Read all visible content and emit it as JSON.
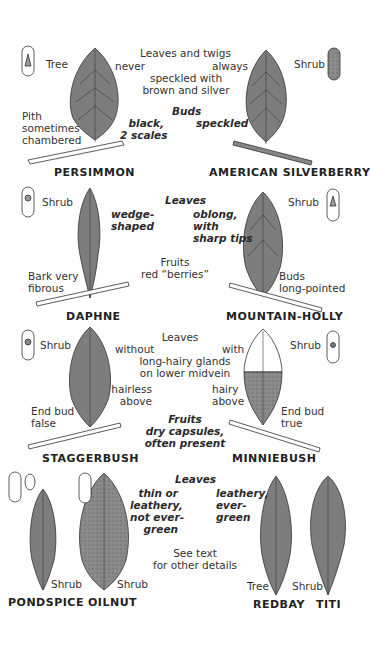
{
  "colors": {
    "leaf_fill": "#7d7d7d",
    "leaf_stroke": "#333333",
    "vein": "#3a3a3a",
    "text": "#333333",
    "background": "#ffffff"
  },
  "panels": [
    {
      "species": [
        {
          "name": "PERSIMMON",
          "habit": "Tree",
          "note": [
            "Pith",
            "sometimes",
            "chambered"
          ],
          "icon": "pith-chambered-icon"
        },
        {
          "name": "AMERICAN SILVERBERRY",
          "habit": "Shrub",
          "icon": "pith-speckled-icon"
        }
      ],
      "center": {
        "leaves_line": "Leaves and twigs",
        "left_word": "never",
        "right_word": "always",
        "detail": [
          "speckled with",
          "brown and silver"
        ],
        "buds_label": "Buds",
        "buds_left": [
          "black,",
          "2 scales"
        ],
        "buds_right": "speckled"
      }
    },
    {
      "species": [
        {
          "name": "DAPHNE",
          "habit": "Shrub",
          "note": [
            "Bark very",
            "fibrous"
          ],
          "leaf_note": [
            "wedge-",
            "shaped"
          ]
        },
        {
          "name": "MOUNTAIN-HOLLY",
          "habit": "Shrub",
          "note": [
            "Buds",
            "long-pointed"
          ]
        }
      ],
      "center": {
        "leaves_label": "Leaves",
        "leaves_detail": [
          "oblong,",
          "with",
          "sharp tips"
        ],
        "fruits": [
          "Fruits",
          "red “berries”"
        ]
      }
    },
    {
      "species": [
        {
          "name": "STAGGERBUSH",
          "habit": "Shrub",
          "note": [
            "End bud",
            "false"
          ],
          "surface": [
            "hairless",
            "above"
          ]
        },
        {
          "name": "MINNIEBUSH",
          "habit": "Shrub",
          "note": [
            "End bud",
            "true"
          ],
          "surface": [
            "hairy",
            "above"
          ]
        }
      ],
      "center": {
        "leaves_label": "Leaves",
        "left_word": "without",
        "right_word": "with",
        "detail": [
          "long-hairy glands",
          "on lower midvein"
        ],
        "fruits": [
          "Fruits",
          "dry capsules,",
          "often present"
        ]
      }
    },
    {
      "species": [
        {
          "name": "PONDSPICE",
          "habit": "Shrub"
        },
        {
          "name": "OILNUT",
          "habit": "Shrub"
        },
        {
          "name": "REDBAY",
          "habit": "Tree"
        },
        {
          "name": "TITI",
          "habit": "Shrub"
        }
      ],
      "center": {
        "leaves_label": "Leaves",
        "left_detail": [
          "thin or",
          "leathery,",
          "not ever-",
          "green"
        ],
        "right_detail": [
          "leathery,",
          "ever-",
          "green"
        ],
        "see_text": [
          "See text",
          "for other details"
        ]
      }
    }
  ]
}
